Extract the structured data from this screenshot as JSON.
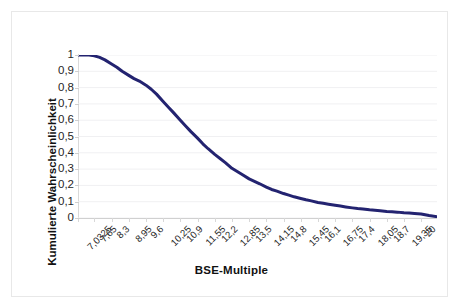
{
  "chart_data": {
    "type": "line",
    "title": "",
    "xlabel": "BSE-Multiple",
    "ylabel": "Kumulierte Wahrscheinlichkeit",
    "xlim": [
      7.0325,
      20.6
    ],
    "ylim": [
      0,
      1
    ],
    "grid": true,
    "legend": "none",
    "line_color": "#232370",
    "line_width": 3,
    "decimal_separator": ",",
    "x_tick_labels": [
      "7,0325",
      "7,65",
      "8,3",
      "8,95",
      "9,6",
      "10,25",
      "10,9",
      "11,55",
      "12,2",
      "12,85",
      "13,5",
      "14,15",
      "14,8",
      "15,45",
      "16,1",
      "16,75",
      "17,4",
      "18,05",
      "18,7",
      "19,35",
      "20"
    ],
    "x_tick_values": [
      7.0325,
      7.65,
      8.3,
      8.95,
      9.6,
      10.25,
      10.9,
      11.55,
      12.2,
      12.85,
      13.5,
      14.15,
      14.8,
      15.45,
      16.1,
      16.75,
      17.4,
      18.05,
      18.7,
      19.35,
      20
    ],
    "y_tick_labels": [
      "1",
      "0,9",
      "0,8",
      "0,7",
      "0,6",
      "0,5",
      "0,4",
      "0,3",
      "0,2",
      "0,1",
      "0"
    ],
    "y_tick_values": [
      1,
      0.9,
      0.8,
      0.7,
      0.6,
      0.5,
      0.4,
      0.3,
      0.2,
      0.1,
      0
    ],
    "series": [
      {
        "name": "Kumulierte Wahrscheinlichkeit",
        "x": [
          7.0325,
          7.25,
          7.45,
          7.65,
          7.85,
          8.05,
          8.3,
          8.5,
          8.7,
          8.95,
          9.15,
          9.35,
          9.6,
          9.8,
          10.0,
          10.25,
          10.45,
          10.65,
          10.9,
          11.1,
          11.3,
          11.55,
          11.75,
          11.95,
          12.2,
          12.4,
          12.6,
          12.85,
          13.05,
          13.25,
          13.5,
          13.7,
          13.9,
          14.15,
          14.35,
          14.55,
          14.8,
          15.0,
          15.2,
          15.45,
          15.65,
          15.85,
          16.1,
          16.3,
          16.5,
          16.75,
          16.95,
          17.15,
          17.4,
          17.6,
          17.8,
          18.05,
          18.25,
          18.45,
          18.7,
          18.9,
          19.1,
          19.35,
          19.55,
          19.75,
          20.0,
          20.3,
          20.6
        ],
        "y": [
          1.0,
          1.0,
          1.0,
          0.995,
          0.985,
          0.97,
          0.945,
          0.925,
          0.9,
          0.875,
          0.855,
          0.84,
          0.815,
          0.79,
          0.76,
          0.715,
          0.68,
          0.645,
          0.6,
          0.565,
          0.53,
          0.49,
          0.455,
          0.425,
          0.39,
          0.365,
          0.34,
          0.305,
          0.285,
          0.265,
          0.24,
          0.225,
          0.21,
          0.19,
          0.175,
          0.165,
          0.15,
          0.14,
          0.13,
          0.12,
          0.112,
          0.105,
          0.095,
          0.09,
          0.085,
          0.078,
          0.073,
          0.068,
          0.062,
          0.058,
          0.055,
          0.05,
          0.047,
          0.044,
          0.04,
          0.038,
          0.036,
          0.032,
          0.03,
          0.028,
          0.025,
          0.015,
          0.008
        ]
      }
    ]
  },
  "axes": {
    "x_title": "BSE-Multiple",
    "y_title": "Kumulierte Wahrscheinlichkeit"
  }
}
